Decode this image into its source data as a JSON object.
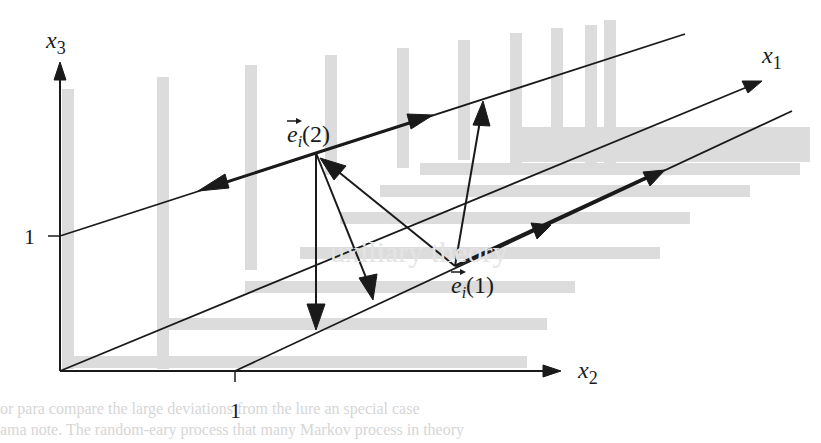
{
  "diagram": {
    "axes": {
      "x1_label": "x",
      "x1_sub": "1",
      "x2_label": "x",
      "x2_sub": "2",
      "x3_label": "x",
      "x3_sub": "3",
      "x2_tick_label": "1",
      "x3_tick_label": "1"
    },
    "points": {
      "e2_label": "e",
      "e2_sub": "i",
      "e2_arg": "(2)",
      "e1_label": "e",
      "e1_sub": "i",
      "e1_arg": "(1)"
    },
    "colors": {
      "ink": "#1a1a1a",
      "shadow": "#d9d9d9",
      "background": "#ffffff"
    }
  },
  "bleed_text": {
    "line1": "uxiliary theory",
    "line2": "or para compare the large deviations from the lure an special case",
    "line3": "ama note. The random-eary process that many Markov process in theory"
  }
}
